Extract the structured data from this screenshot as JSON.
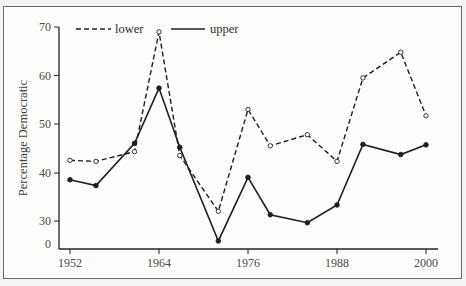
{
  "chart_data": {
    "type": "line",
    "title": "",
    "xlabel": "",
    "ylabel": "Percentage Democratic",
    "x_ticks": [
      "1952",
      "1964",
      "1976",
      "1988",
      "2000"
    ],
    "y_ticks": [
      "0",
      "30",
      "40",
      "50",
      "60",
      "70"
    ],
    "ylim": [
      0,
      70
    ],
    "y_axis_broken": true,
    "xlim": [
      1952,
      2000
    ],
    "grid": false,
    "legend_position": "top-left",
    "x": [
      1952,
      1955.5,
      1960.7,
      1964,
      1966.8,
      1972,
      1976,
      1979,
      1984,
      1988,
      1991.5,
      1996.6,
      2000
    ],
    "series": [
      {
        "name": "lower",
        "style": "dashed",
        "marker": "open-circle",
        "values": [
          42.5,
          42.3,
          44.3,
          69.0,
          43.5,
          32.0,
          53.0,
          45.5,
          47.8,
          42.3,
          59.5,
          64.8,
          51.7
        ]
      },
      {
        "name": "upper",
        "style": "solid",
        "marker": "filled-circle",
        "values": [
          38.5,
          37.3,
          46.0,
          57.4,
          45.2,
          4.0,
          39.0,
          31.3,
          27.8,
          33.3,
          45.8,
          43.7,
          45.7
        ]
      }
    ]
  },
  "legend": {
    "lower_label": "lower",
    "upper_label": "upper"
  },
  "axis": {
    "ylabel": "Percentage Democratic",
    "y_tick_labels": [
      "70",
      "60",
      "50",
      "40",
      "30",
      "0"
    ],
    "x_tick_labels": [
      "1952",
      "1964",
      "1976",
      "1988",
      "2000"
    ]
  }
}
